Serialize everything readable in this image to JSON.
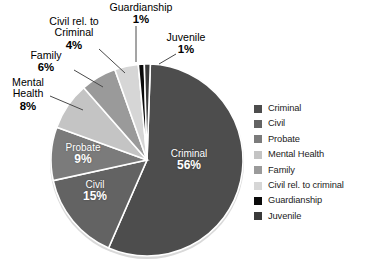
{
  "chart_data": {
    "type": "pie",
    "title": "",
    "categories": [
      "Criminal",
      "Civil",
      "Probate",
      "Mental Health",
      "Family",
      "Civil rel. to criminal",
      "Guardianship",
      "Juvenile"
    ],
    "values": [
      56,
      15,
      9,
      8,
      6,
      4,
      1,
      1
    ],
    "value_unit": "%",
    "total": 100,
    "legend_position": "right",
    "grid": false,
    "colors": [
      "#4d4d4d",
      "#636363",
      "#7b7b7b",
      "#c4c4c4",
      "#9a9a9a",
      "#d6d6d6",
      "#0a0a0a",
      "#3a3a3a"
    ],
    "slice_label_format": "name + percent",
    "labels": [
      {
        "name": "Criminal",
        "percent": "56%",
        "placement": "inside"
      },
      {
        "name": "Civil",
        "percent": "15%",
        "placement": "inside"
      },
      {
        "name": "Probate",
        "percent": "9%",
        "placement": "inside"
      },
      {
        "name": "Mental Health",
        "percent": "8%",
        "placement": "outside"
      },
      {
        "name": "Family",
        "percent": "6%",
        "placement": "outside"
      },
      {
        "name": "Civil rel. to Criminal",
        "percent": "4%",
        "placement": "outside"
      },
      {
        "name": "Guardianship",
        "percent": "1%",
        "placement": "outside"
      },
      {
        "name": "Juvenile",
        "percent": "1%",
        "placement": "outside"
      }
    ]
  },
  "callouts": {
    "guardianship": {
      "line1": "Guardianship",
      "percent": "1%"
    },
    "juvenile": {
      "line1": "Juvenile",
      "percent": "1%"
    },
    "civil_rel": {
      "line1": "Civil rel. to",
      "line2": "Criminal",
      "percent": "4%"
    },
    "family": {
      "line1": "Family",
      "percent": "6%"
    },
    "mental_health": {
      "line1": "Mental",
      "line2": "Health",
      "percent": "8%"
    }
  },
  "inside_labels": {
    "criminal": {
      "name": "Criminal",
      "percent": "56%"
    },
    "civil": {
      "name": "Civil",
      "percent": "15%"
    },
    "probate": {
      "name": "Probate",
      "percent": "9%"
    }
  },
  "legend": {
    "items": [
      {
        "label": "Criminal",
        "color": "#4d4d4d"
      },
      {
        "label": "Civil",
        "color": "#636363"
      },
      {
        "label": "Probate",
        "color": "#7b7b7b"
      },
      {
        "label": "Mental Health",
        "color": "#c4c4c4"
      },
      {
        "label": "Family",
        "color": "#9a9a9a"
      },
      {
        "label": "Civil rel. to criminal",
        "color": "#d6d6d6"
      },
      {
        "label": "Guardianship",
        "color": "#0a0a0a"
      },
      {
        "label": "Juvenile",
        "color": "#3a3a3a"
      }
    ]
  }
}
